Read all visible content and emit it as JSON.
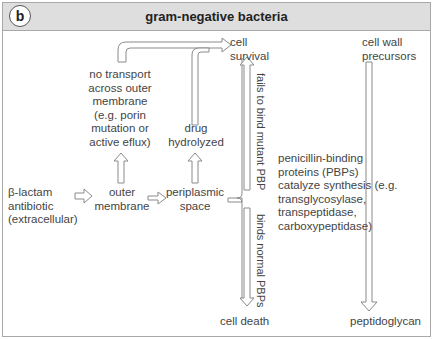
{
  "panel": {
    "badge": "b",
    "title": "gram-negative bacteria"
  },
  "nodes": {
    "antibiotic": [
      "β-lactam",
      "antibiotic",
      "(extracellular)"
    ],
    "outer_membrane": [
      "outer",
      "membrane"
    ],
    "periplasmic_space": [
      "periplasmic",
      "space"
    ],
    "no_transport": [
      "no transport",
      "across outer",
      "membrane",
      "(e.g. porin",
      "mutation or",
      "active eflux)"
    ],
    "drug_hydrolyzed": [
      "drug",
      "hydrolyzed"
    ],
    "cell_survival": [
      "cell",
      "survival"
    ],
    "cell_death": "cell death",
    "pbps": [
      "penicillin-binding",
      "proteins (PBPs)",
      "catalyze synthesis (e.g.",
      "transglycosylase,",
      "transpeptidase,",
      "carboxypeptidase)"
    ],
    "cell_wall_precursors": [
      "cell wall",
      "precursors"
    ],
    "peptidoglycan": "peptidoglycan"
  },
  "edge_labels": {
    "fails_to_bind": "fails to bind mutant PBP",
    "binds_normal": "binds normal PBPs"
  },
  "colors": {
    "header_bg": "#dedede",
    "border": "#a9a9a9",
    "arrow": "#8a8a8a",
    "text": "#444444"
  }
}
